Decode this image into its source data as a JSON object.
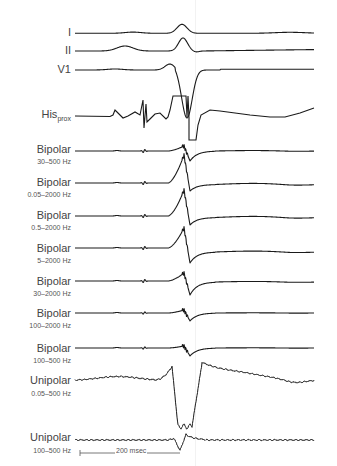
{
  "figure": {
    "type": "intracardiac electrogram recordings with different filter settings",
    "scale_bar": {
      "label": "200 msec",
      "duration_ms": 200
    },
    "channels": [
      {
        "id": "I",
        "label": "I",
        "filter": ""
      },
      {
        "id": "II",
        "label": "II",
        "filter": ""
      },
      {
        "id": "V1",
        "label": "V1",
        "filter": ""
      },
      {
        "id": "His",
        "label": "His",
        "label_sub": "prox",
        "filter": ""
      },
      {
        "id": "bip1",
        "label": "Bipolar",
        "filter": "30–500 Hz"
      },
      {
        "id": "bip2",
        "label": "Bipolar",
        "filter": "0.05–2000 Hz"
      },
      {
        "id": "bip3",
        "label": "Bipolar",
        "filter": "0.5–2000 Hz"
      },
      {
        "id": "bip4",
        "label": "Bipolar",
        "filter": "5–2000 Hz"
      },
      {
        "id": "bip5",
        "label": "Bipolar",
        "filter": "30–2000 Hz"
      },
      {
        "id": "bip6",
        "label": "Bipolar",
        "filter": "100–2000 Hz"
      },
      {
        "id": "bip7",
        "label": "Bipolar",
        "filter": "100–500 Hz"
      },
      {
        "id": "uni1",
        "label": "Unipolar",
        "filter": "0.05–500 Hz"
      },
      {
        "id": "uni2",
        "label": "Unipolar",
        "filter": "100–500 Hz"
      }
    ]
  }
}
